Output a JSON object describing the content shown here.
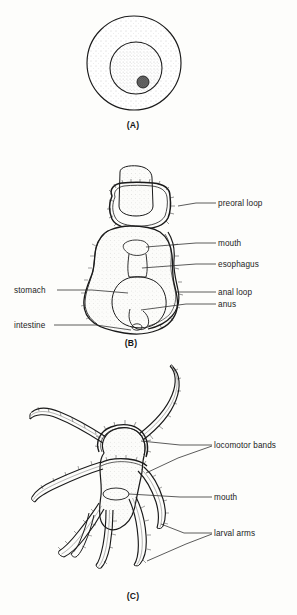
{
  "figure": {
    "title_visible": false,
    "background_color": "#fdfdfb",
    "ink_color": "#1a1a1a",
    "panels": [
      {
        "id": "A",
        "letter": "(A)",
        "caption_x": 133,
        "caption_y": 128,
        "subject": "egg",
        "labels": []
      },
      {
        "id": "B",
        "letter": "(B)",
        "caption_x": 131,
        "caption_y": 346,
        "subject": "bipinnaria-larva-early",
        "labels": [
          {
            "name": "preoral-loop",
            "text": "preoral loop",
            "text_x": 218,
            "text_y": 206,
            "anchor": "start",
            "leader": [
              [
                218,
                203
              ],
              [
                196,
                203
              ],
              [
                177,
                207
              ]
            ]
          },
          {
            "name": "mouth",
            "text": "mouth",
            "text_x": 218,
            "text_y": 246,
            "anchor": "start",
            "leader": [
              [
                216,
                243
              ],
              [
                196,
                243
              ],
              [
                136,
                250
              ]
            ]
          },
          {
            "name": "esophagus",
            "text": "esophagus",
            "text_x": 218,
            "text_y": 267,
            "anchor": "start",
            "leader": [
              [
                216,
                264
              ],
              [
                196,
                264
              ],
              [
                141,
                268
              ]
            ]
          },
          {
            "name": "anal-loop",
            "text": "anal loop",
            "text_x": 218,
            "text_y": 295,
            "anchor": "start",
            "leader": [
              [
                216,
                292
              ],
              [
                186,
                292
              ],
              [
                172,
                292
              ]
            ]
          },
          {
            "name": "anus",
            "text": "anus",
            "text_x": 218,
            "text_y": 307,
            "anchor": "start",
            "leader": [
              [
                216,
                304
              ],
              [
                186,
                304
              ],
              [
                133,
                308
              ]
            ]
          },
          {
            "name": "stomach",
            "text": "stomach",
            "text_x": 14,
            "text_y": 293,
            "anchor": "start",
            "leader": [
              [
                57,
                290
              ],
              [
                92,
                290
              ],
              [
                110,
                292
              ]
            ]
          },
          {
            "name": "intestine",
            "text": "intestine",
            "text_x": 14,
            "text_y": 328,
            "anchor": "start",
            "leader": [
              [
                54,
                325
              ],
              [
                96,
                325
              ],
              [
                127,
                329
              ]
            ]
          }
        ]
      },
      {
        "id": "C",
        "letter": "(C)",
        "caption_x": 133,
        "caption_y": 599,
        "subject": "bipinnaria-larva-late",
        "labels": [
          {
            "name": "locomotor-bands",
            "text": "locomotor bands",
            "text_x": 214,
            "text_y": 448,
            "anchor": "start",
            "leader": [
              [
                212,
                445
              ],
              [
                180,
                445
              ],
              [
                140,
                443
              ]
            ]
          },
          {
            "name": "locomotor-bands-second",
            "text": "",
            "text_x": 0,
            "text_y": 0,
            "anchor": "start",
            "leader": [
              [
                212,
                446
              ],
              [
                176,
                460
              ],
              [
                147,
                475
              ]
            ]
          },
          {
            "name": "mouth",
            "text": "mouth",
            "text_x": 214,
            "text_y": 500,
            "anchor": "start",
            "leader": [
              [
                212,
                497
              ],
              [
                180,
                497
              ],
              [
                128,
                495
              ]
            ]
          },
          {
            "name": "larval-arms",
            "text": "larval arms",
            "text_x": 214,
            "text_y": 536,
            "anchor": "start",
            "leader": [
              [
                212,
                533
              ],
              [
                184,
                533
              ],
              [
                160,
                526
              ]
            ]
          },
          {
            "name": "larval-arms-second",
            "text": "",
            "text_x": 0,
            "text_y": 0,
            "anchor": "start",
            "leader": [
              [
                212,
                534
              ],
              [
                186,
                545
              ],
              [
                146,
                562
              ]
            ]
          }
        ]
      }
    ],
    "egg": {
      "outer_membrane": {
        "cx": 134,
        "cy": 63,
        "r": 47
      },
      "nucleus": {
        "cx": 136,
        "cy": 68,
        "r": 26
      },
      "nucleolus": {
        "cx": 143,
        "cy": 82,
        "r": 6,
        "color": "#4a4a4a"
      }
    }
  }
}
